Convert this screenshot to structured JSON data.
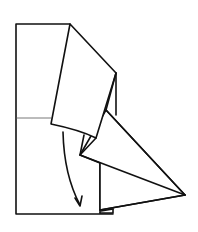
{
  "figure": {
    "type": "origami-fold-diagram",
    "colors": {
      "line": "#111111",
      "crease": "#555555",
      "paper": "#ffffff"
    },
    "elements": {
      "base_rectangle": "base paper rectangle",
      "horizontal_crease": "midline crease",
      "folded_flap": "upper folded flap",
      "triangle_point": "pointed triangular fold",
      "fold_arrow": "curved arrow pointing down"
    }
  }
}
